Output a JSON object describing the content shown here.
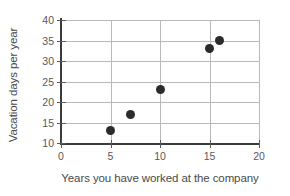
{
  "chart_data": {
    "type": "scatter",
    "title": "",
    "xlabel": "Years you have worked at the company",
    "ylabel": "Vacation days per year",
    "xlim": [
      0,
      20
    ],
    "ylim": [
      10,
      40
    ],
    "xticks": [
      0,
      5,
      10,
      15,
      20
    ],
    "yticks": [
      10,
      15,
      20,
      25,
      30,
      35,
      40
    ],
    "grid": true,
    "legend": null,
    "marker_color": "#2b2b2b",
    "points": [
      {
        "x": 5,
        "y": 13
      },
      {
        "x": 7,
        "y": 17
      },
      {
        "x": 10,
        "y": 23
      },
      {
        "x": 15,
        "y": 33
      },
      {
        "x": 16,
        "y": 35
      }
    ]
  }
}
